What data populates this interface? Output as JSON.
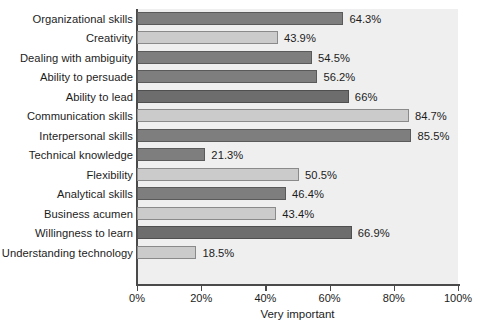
{
  "chart_data": {
    "type": "bar",
    "orientation": "horizontal",
    "title": "",
    "xlabel": "Very important",
    "ylabel": "",
    "xlim": [
      0,
      100
    ],
    "xticks": [
      "0%",
      "20%",
      "40%",
      "60%",
      "80%",
      "100%"
    ],
    "xtick_values": [
      0,
      20,
      40,
      60,
      80,
      100
    ],
    "grid": false,
    "legend": null,
    "categories": [
      "Organizational skills",
      "Creativity",
      "Dealing with ambiguity",
      "Ability to persuade",
      "Ability to lead",
      "Communication skills",
      "Interpersonal skills",
      "Technical knowledge",
      "Flexibility",
      "Analytical skills",
      "Business acumen",
      "Willingness to learn",
      "Understanding technology"
    ],
    "values": [
      64.3,
      43.9,
      54.5,
      56.2,
      66,
      84.7,
      85.5,
      21.3,
      50.5,
      46.4,
      43.4,
      66.9,
      18.5
    ],
    "value_labels": [
      "64.3%",
      "43.9%",
      "54.5%",
      "56.2%",
      "66%",
      "84.7%",
      "85.5%",
      "21.3%",
      "50.5%",
      "46.4%",
      "43.4%",
      "66.9%",
      "18.5%"
    ],
    "bar_shades": [
      "dark",
      "light",
      "dark",
      "dark",
      "darker",
      "light",
      "dark",
      "dark",
      "light",
      "dark",
      "light",
      "darker",
      "light"
    ],
    "colors": {
      "bar_dark": "#7e7e7e",
      "bar_darker": "#6d6d6d",
      "bar_light": "#cbcbcb",
      "bar_outline": "#6a6a6a",
      "plot_background": "#efefef",
      "axis": "#4a4a4a",
      "text": "#1c1c1c",
      "page_background": "#ffffff"
    }
  },
  "clipped_header_text": ""
}
